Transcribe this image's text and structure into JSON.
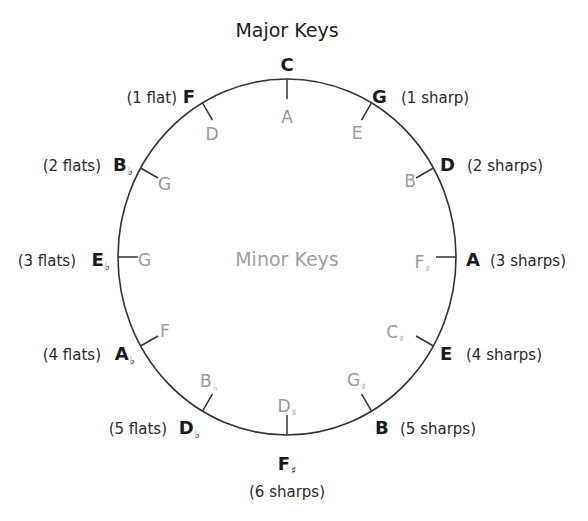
{
  "title": "Major Keys",
  "center_label": "Minor Keys",
  "colors": {
    "major": "#1a1a1a",
    "count": "#2a2a2a",
    "minor": "#9a9a9a",
    "ring": "#333333"
  },
  "keys": [
    {
      "major": "C",
      "major_accidental": "",
      "count": "",
      "minor": "A",
      "minor_accidental": ""
    },
    {
      "major": "G",
      "major_accidental": "",
      "count": "(1 sharp)",
      "minor": "E",
      "minor_accidental": ""
    },
    {
      "major": "D",
      "major_accidental": "",
      "count": "(2 sharps)",
      "minor": "B",
      "minor_accidental": ""
    },
    {
      "major": "A",
      "major_accidental": "",
      "count": "(3 sharps)",
      "minor": "F",
      "minor_accidental": "♯"
    },
    {
      "major": "E",
      "major_accidental": "",
      "count": "(4 sharps)",
      "minor": "C",
      "minor_accidental": "♯"
    },
    {
      "major": "B",
      "major_accidental": "",
      "count": "(5 sharps)",
      "minor": "G",
      "minor_accidental": "♯"
    },
    {
      "major": "F",
      "major_accidental": "♯",
      "count": "(6 sharps)",
      "minor": "D",
      "minor_accidental": "♯"
    },
    {
      "major": "D",
      "major_accidental": "♭",
      "count": "(5 flats)",
      "minor": "B",
      "minor_accidental": "♭"
    },
    {
      "major": "A",
      "major_accidental": "♭",
      "count": "(4 flats)",
      "minor": "F",
      "minor_accidental": ""
    },
    {
      "major": "E",
      "major_accidental": "♭",
      "count": "(3 flats)",
      "minor": "G",
      "minor_accidental": ""
    },
    {
      "major": "B",
      "major_accidental": "♭",
      "count": "(2 flats)",
      "minor": "G",
      "minor_accidental": ""
    },
    {
      "major": "F",
      "major_accidental": "",
      "count": "(1 flat)",
      "minor": "D",
      "minor_accidental": ""
    }
  ]
}
